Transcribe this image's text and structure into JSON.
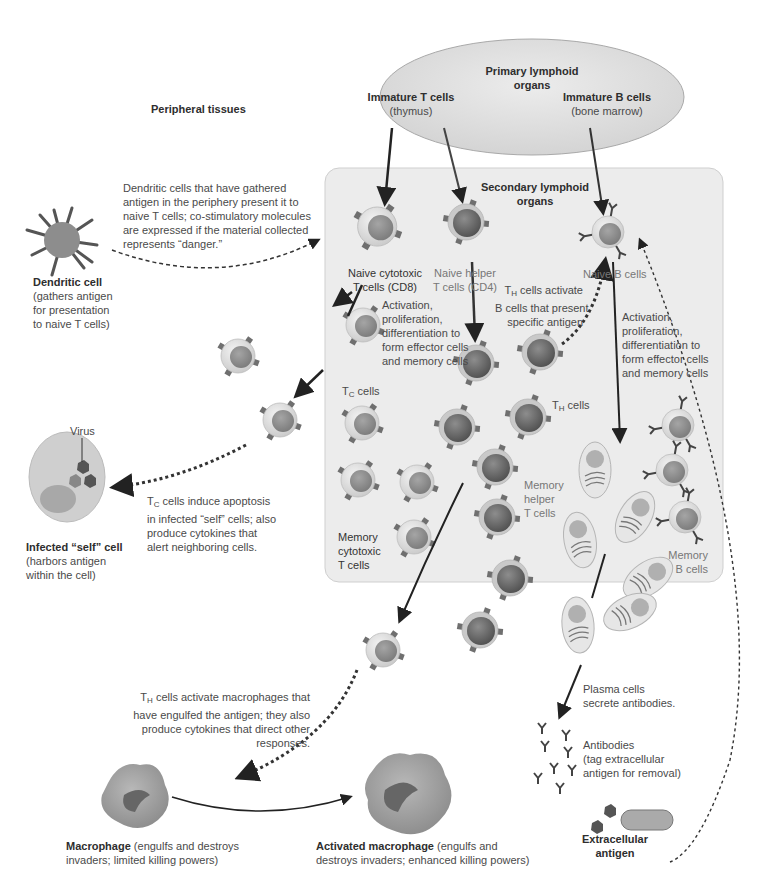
{
  "header": {
    "caption_fragment": ""
  },
  "regions": {
    "primary": {
      "title": "Primary lymphoid organs",
      "title_line1": "Primary lymphoid",
      "title_line2": "organs",
      "immature_t": "Immature T cells",
      "immature_t_site": "(thymus)",
      "immature_b": "Immature B cells",
      "immature_b_site": "(bone marrow)"
    },
    "peripheral": {
      "title": "Peripheral tissues"
    },
    "secondary": {
      "title_line1": "Secondary lymphoid",
      "title_line2": "organs"
    }
  },
  "labels": {
    "dendritic_desc": [
      "Dendritic cells that have gathered",
      "antigen in the periphery present it to",
      "naive T cells; co-stimulatory molecules",
      "are expressed if the material collected",
      "represents “danger.”"
    ],
    "dendritic_title": "Dendritic cell",
    "dendritic_sub": [
      "(gathers antigen",
      "for presentation",
      "to naive T cells)"
    ],
    "naive_cyto": [
      "Naive cytotoxic",
      "T cells (CD8)"
    ],
    "naive_helper": [
      "Naive helper",
      "T cells (CD4)"
    ],
    "naive_b": "Naive B cells",
    "th_activate_b": [
      "cells activate",
      "B cells that present",
      "specific antigen"
    ],
    "activation_t": [
      "Activation,",
      "proliferation,",
      "differentiation to",
      "form effector cells",
      "and memory cells"
    ],
    "activation_b": [
      "Activation,",
      "proliferation,",
      "differentiation to",
      "form effector cells",
      "and memory cells"
    ],
    "tc_cells": "cells",
    "th_cells": "cells",
    "virus": "Virus",
    "tc_induce": [
      "cells induce apoptosis",
      "in infected “self” cells; also",
      "produce cytokines that",
      "alert neighboring cells."
    ],
    "infected_title": "Infected “self” cell",
    "infected_sub": [
      "(harbors antigen",
      "within the cell)"
    ],
    "memory_cyto": [
      "Memory",
      "cytotoxic",
      "T cells"
    ],
    "memory_helper": [
      "Memory",
      "helper",
      "T cells"
    ],
    "memory_b": [
      "Memory",
      "B cells"
    ],
    "th_macro": [
      "cells activate macrophages that",
      "have engulfed the antigen; they also",
      "produce cytokines that direct other",
      "responses."
    ],
    "plasma": [
      "Plasma cells",
      "secrete antibodies."
    ],
    "antibodies": [
      "Antibodies",
      "(tag extracellular",
      "antigen for removal)"
    ],
    "macrophage_title": "Macrophage",
    "macrophage_desc": [
      " (engulfs and destroys",
      "invaders; limited killing powers)"
    ],
    "act_macro_title": "Activated macrophage",
    "act_macro_desc": [
      " (engulfs and",
      "destroys invaders; enhanced killing powers)"
    ],
    "extracellular": [
      "Extracellular",
      "antigen"
    ],
    "sub_T": "T",
    "sub_C": "C",
    "sub_H": "H"
  },
  "colors": {
    "secondary_box": "#ececec",
    "ellipse": "#e2e2e2",
    "cell_outer": "#dcdcdc",
    "cell_nucleus": "#8a8a8a",
    "helper_nucleus": "#6a6a6a",
    "receptor": "#6f6f6f",
    "arrow": "#222222"
  }
}
